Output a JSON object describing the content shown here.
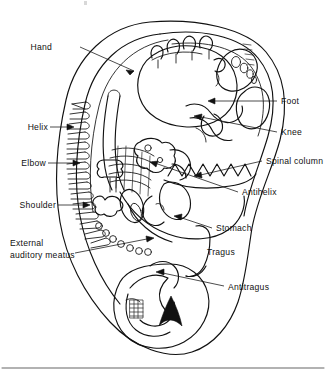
{
  "figure": {
    "type": "anatomical line diagram",
    "background_color": "#ffffff",
    "line_color": "#111111"
  },
  "labels": {
    "hand": "Hand",
    "helix": "Helix",
    "elbow": "Elbow",
    "shoulder": "Shoulder",
    "external_auditory_meatus_line1": "External",
    "external_auditory_meatus_line2": "auditory meatus",
    "foot": "Foot",
    "knee": "Knee",
    "spinal_column": "Spinal column",
    "antihelix": "Antihelix",
    "stomach": "Stomach",
    "tragus": "Tragus",
    "antitragus": "Antitragus"
  },
  "label_list": [
    {
      "id": "hand",
      "text": "Hand",
      "side": "left",
      "x": 52,
      "y": 50,
      "has_leader": true
    },
    {
      "id": "helix",
      "text": "Helix",
      "side": "left",
      "x": 26,
      "y": 129,
      "has_leader": true
    },
    {
      "id": "elbow",
      "text": "Elbow",
      "side": "left",
      "x": 22,
      "y": 164,
      "has_leader": true
    },
    {
      "id": "shoulder",
      "text": "Shoulder",
      "side": "left",
      "x": 13,
      "y": 206,
      "has_leader": true
    },
    {
      "id": "eam1",
      "text": "External",
      "side": "left",
      "x": 10,
      "y": 245,
      "has_leader": true
    },
    {
      "id": "eam2",
      "text": "auditory meatus",
      "side": "left",
      "x": 10,
      "y": 257,
      "has_leader": true
    },
    {
      "id": "foot",
      "text": "Foot",
      "side": "right",
      "x": 280,
      "y": 103,
      "has_leader": true
    },
    {
      "id": "knee",
      "text": "Knee",
      "side": "right",
      "x": 280,
      "y": 134,
      "has_leader": true
    },
    {
      "id": "spinal",
      "text": "Spinal column",
      "side": "right",
      "x": 266,
      "y": 163,
      "has_leader": true
    },
    {
      "id": "antihel",
      "text": "Antihelix",
      "side": "right",
      "x": 242,
      "y": 194,
      "has_leader": true
    },
    {
      "id": "stomach",
      "text": "Stomach",
      "side": "right",
      "x": 215,
      "y": 230,
      "has_leader": true
    },
    {
      "id": "tragus",
      "text": "Tragus",
      "side": "right",
      "x": 207,
      "y": 253,
      "has_leader": false
    },
    {
      "id": "antitra",
      "text": "Antitragus",
      "side": "right",
      "x": 228,
      "y": 288,
      "has_leader": true
    }
  ],
  "anatomy_parts": [
    "helix rim",
    "antihelix",
    "tragus",
    "antitragus",
    "earlobe",
    "external auditory meatus",
    "concha"
  ],
  "homunculus_parts": [
    "head",
    "hand",
    "fingers",
    "elbow",
    "shoulder",
    "spinal column / vertebrae",
    "knee",
    "foot",
    "toes",
    "stomach"
  ]
}
